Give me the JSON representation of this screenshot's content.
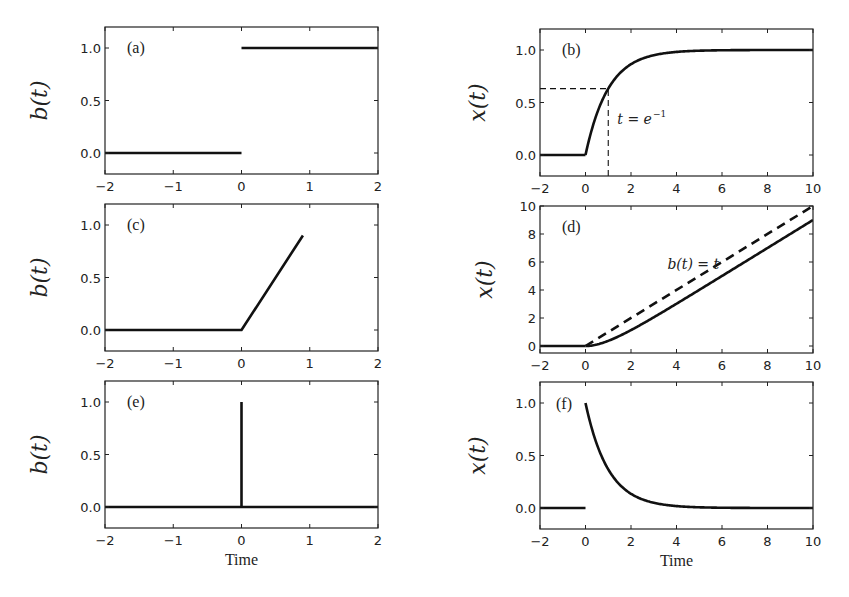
{
  "chart_data": [
    {
      "panel": "a",
      "tag": "(a)",
      "type": "line",
      "ylabel": "b(t)",
      "xlabel": "",
      "xlim": [
        -2,
        2
      ],
      "ylim": [
        -0.2,
        1.2
      ],
      "xticks": [
        -2,
        -1,
        0,
        1,
        2
      ],
      "xtick_labels": [
        "−2",
        "−1",
        "0",
        "1",
        "2"
      ],
      "yticks": [
        0.0,
        0.5,
        1.0
      ],
      "ytick_labels": [
        "0.0",
        "0.5",
        "1.0"
      ],
      "grid": false,
      "description": "Unit step input",
      "series": [
        {
          "name": "step-before",
          "style": "solid",
          "x": [
            -2,
            0
          ],
          "y": [
            0,
            0
          ]
        },
        {
          "name": "step-after",
          "style": "solid",
          "x": [
            0,
            2
          ],
          "y": [
            1,
            1
          ]
        }
      ]
    },
    {
      "panel": "b",
      "tag": "(b)",
      "type": "line",
      "ylabel": "x(t)",
      "xlabel": "",
      "xlim": [
        -2,
        10
      ],
      "ylim": [
        -0.2,
        1.2
      ],
      "xticks": [
        -2,
        0,
        2,
        4,
        6,
        8,
        10
      ],
      "xtick_labels": [
        "−2",
        "0",
        "2",
        "4",
        "6",
        "8",
        "10"
      ],
      "yticks": [
        0.0,
        0.5,
        1.0
      ],
      "ytick_labels": [
        "0.0",
        "0.5",
        "1.0"
      ],
      "grid": false,
      "description": "Step response x(t) = 1 - e^{-t}",
      "annotation": {
        "text": "t = e",
        "superscript": "−1",
        "x": 1.4,
        "y": 0.3
      },
      "series": [
        {
          "name": "response-before",
          "style": "solid",
          "x": [
            -2,
            0
          ],
          "y": [
            0,
            0
          ]
        },
        {
          "name": "response",
          "style": "solid",
          "function": "1-exp(-t)",
          "x": [
            0,
            0.5,
            1,
            1.5,
            2,
            3,
            4,
            5,
            6,
            8,
            10
          ],
          "y": [
            0,
            0.39,
            0.63,
            0.78,
            0.86,
            0.95,
            0.98,
            0.99,
            1.0,
            1.0,
            1.0
          ]
        },
        {
          "name": "guide-horizontal",
          "style": "dashed",
          "x": [
            -2,
            1
          ],
          "y": [
            0.632,
            0.632
          ]
        },
        {
          "name": "guide-vertical",
          "style": "dashed",
          "x": [
            1,
            1
          ],
          "y": [
            -0.2,
            0.632
          ]
        }
      ]
    },
    {
      "panel": "c",
      "tag": "(c)",
      "type": "line",
      "ylabel": "b(t)",
      "xlabel": "",
      "xlim": [
        -2,
        2
      ],
      "ylim": [
        -0.2,
        1.2
      ],
      "xticks": [
        -2,
        -1,
        0,
        1,
        2
      ],
      "xtick_labels": [
        "−2",
        "−1",
        "0",
        "1",
        "2"
      ],
      "yticks": [
        0.0,
        0.5,
        1.0
      ],
      "ytick_labels": [
        "0.0",
        "0.5",
        "1.0"
      ],
      "grid": false,
      "description": "Ramp input",
      "series": [
        {
          "name": "ramp",
          "style": "solid",
          "x": [
            -2,
            0,
            0.9
          ],
          "y": [
            0,
            0,
            0.9
          ]
        }
      ]
    },
    {
      "panel": "d",
      "tag": "(d)",
      "type": "line",
      "ylabel": "x(t)",
      "xlabel": "",
      "xlim": [
        -2,
        10
      ],
      "ylim": [
        -0.5,
        10
      ],
      "xticks": [
        -2,
        0,
        2,
        4,
        6,
        8,
        10
      ],
      "xtick_labels": [
        "−2",
        "0",
        "2",
        "4",
        "6",
        "8",
        "10"
      ],
      "yticks": [
        0,
        2,
        4,
        6,
        8,
        10
      ],
      "ytick_labels": [
        "0",
        "2",
        "4",
        "6",
        "8",
        "10"
      ],
      "grid": false,
      "description": "Ramp response x(t) = t - 1 + e^{-t}",
      "annotation": {
        "text": "b(t) = t",
        "x": 3.6,
        "y": 5.5
      },
      "series": [
        {
          "name": "input-ramp",
          "style": "dashed",
          "x": [
            0,
            10
          ],
          "y": [
            0,
            10
          ]
        },
        {
          "name": "response-before",
          "style": "solid",
          "x": [
            -2,
            0
          ],
          "y": [
            0,
            0
          ]
        },
        {
          "name": "response",
          "style": "solid",
          "function": "t-1+exp(-t)",
          "x": [
            0,
            0.5,
            1,
            1.5,
            2,
            3,
            4,
            6,
            8,
            10
          ],
          "y": [
            0,
            0.11,
            0.37,
            0.72,
            1.14,
            2.05,
            3.02,
            5.0,
            7.0,
            9.0
          ]
        }
      ]
    },
    {
      "panel": "e",
      "tag": "(e)",
      "type": "line",
      "ylabel": "b(t)",
      "xlabel": "Time",
      "xlim": [
        -2,
        2
      ],
      "ylim": [
        -0.2,
        1.2
      ],
      "xticks": [
        -2,
        -1,
        0,
        1,
        2
      ],
      "xtick_labels": [
        "−2",
        "−1",
        "0",
        "1",
        "2"
      ],
      "yticks": [
        0.0,
        0.5,
        1.0
      ],
      "ytick_labels": [
        "0.0",
        "0.5",
        "1.0"
      ],
      "grid": false,
      "description": "Impulse input",
      "series": [
        {
          "name": "baseline",
          "style": "solid",
          "x": [
            -2,
            2
          ],
          "y": [
            0,
            0
          ]
        },
        {
          "name": "impulse",
          "style": "solid",
          "x": [
            0,
            0
          ],
          "y": [
            0,
            1
          ]
        }
      ]
    },
    {
      "panel": "f",
      "tag": "(f)",
      "type": "line",
      "ylabel": "x(t)",
      "xlabel": "Time",
      "xlim": [
        -2,
        10
      ],
      "ylim": [
        -0.2,
        1.2
      ],
      "xticks": [
        -2,
        0,
        2,
        4,
        6,
        8,
        10
      ],
      "xtick_labels": [
        "−2",
        "0",
        "2",
        "4",
        "6",
        "8",
        "10"
      ],
      "yticks": [
        0.0,
        0.5,
        1.0
      ],
      "ytick_labels": [
        "0.0",
        "0.5",
        "1.0"
      ],
      "grid": false,
      "description": "Impulse response x(t) = e^{-t}",
      "series": [
        {
          "name": "response-before",
          "style": "solid",
          "x": [
            -2,
            0
          ],
          "y": [
            0,
            0
          ]
        },
        {
          "name": "response",
          "style": "solid",
          "function": "exp(-t)",
          "x": [
            0,
            0.5,
            1,
            1.5,
            2,
            3,
            4,
            5,
            6,
            8,
            10
          ],
          "y": [
            1.0,
            0.61,
            0.37,
            0.22,
            0.14,
            0.05,
            0.02,
            0.01,
            0.0,
            0.0,
            0.0
          ]
        }
      ]
    }
  ],
  "layout": {
    "panels": {
      "a": {
        "left": 105,
        "top": 27,
        "right": 378,
        "bottom": 174
      },
      "b": {
        "left": 540,
        "top": 29,
        "right": 813,
        "bottom": 176
      },
      "c": {
        "left": 105,
        "top": 204,
        "right": 378,
        "bottom": 351
      },
      "d": {
        "left": 540,
        "top": 206,
        "right": 813,
        "bottom": 353
      },
      "e": {
        "left": 105,
        "top": 381,
        "right": 378,
        "bottom": 528
      },
      "f": {
        "left": 540,
        "top": 382,
        "right": 813,
        "bottom": 529
      }
    }
  }
}
